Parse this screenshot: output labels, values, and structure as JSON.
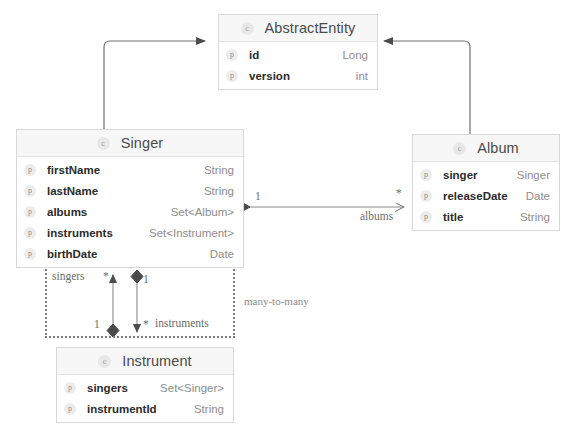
{
  "diagram": {
    "type": "uml-class-diagram",
    "background": "#ffffff",
    "note": "many-to-many"
  },
  "classes": [
    {
      "id": "abstract-entity",
      "name": "AbstractEntity",
      "icon": "class-badge-icon",
      "x": 218,
      "y": 14,
      "width": 160,
      "attributes": [
        {
          "icon": "property-badge-icon",
          "name": "id",
          "type": "Long"
        },
        {
          "icon": "property-badge-icon",
          "name": "version",
          "type": "int"
        }
      ]
    },
    {
      "id": "singer",
      "name": "Singer",
      "icon": "class-badge-icon",
      "x": 16,
      "y": 129,
      "width": 228,
      "attributes": [
        {
          "icon": "property-badge-icon",
          "name": "firstName",
          "type": "String"
        },
        {
          "icon": "property-badge-icon",
          "name": "lastName",
          "type": "String"
        },
        {
          "icon": "property-badge-icon",
          "name": "albums",
          "type": "Set<Album>"
        },
        {
          "icon": "property-badge-icon",
          "name": "instruments",
          "type": "Set<Instrument>"
        },
        {
          "icon": "property-badge-icon",
          "name": "birthDate",
          "type": "Date"
        }
      ]
    },
    {
      "id": "album",
      "name": "Album",
      "icon": "class-badge-icon",
      "x": 412,
      "y": 134,
      "width": 148,
      "attributes": [
        {
          "icon": "property-badge-icon",
          "name": "singer",
          "type": "Singer"
        },
        {
          "icon": "property-badge-icon",
          "name": "releaseDate",
          "type": "Date"
        },
        {
          "icon": "property-badge-icon",
          "name": "title",
          "type": "String"
        }
      ]
    },
    {
      "id": "instrument",
      "name": "Instrument",
      "icon": "class-badge-icon",
      "x": 56,
      "y": 347,
      "width": 178,
      "attributes": [
        {
          "icon": "property-badge-icon",
          "name": "singers",
          "type": "Set<Singer>"
        },
        {
          "icon": "property-badge-icon",
          "name": "instrumentId",
          "type": "String"
        }
      ]
    }
  ],
  "relations": {
    "singer_album": {
      "role_label": "albums",
      "source_multiplicity": "1",
      "target_multiplicity": "*"
    },
    "singer_instrument": {
      "role_label_top": "singers",
      "role_label_bottom": "instruments",
      "mult_top_left": "*",
      "mult_top_right": "1",
      "mult_bottom_left": "1",
      "mult_bottom_right": "*"
    },
    "note": "many-to-many"
  }
}
